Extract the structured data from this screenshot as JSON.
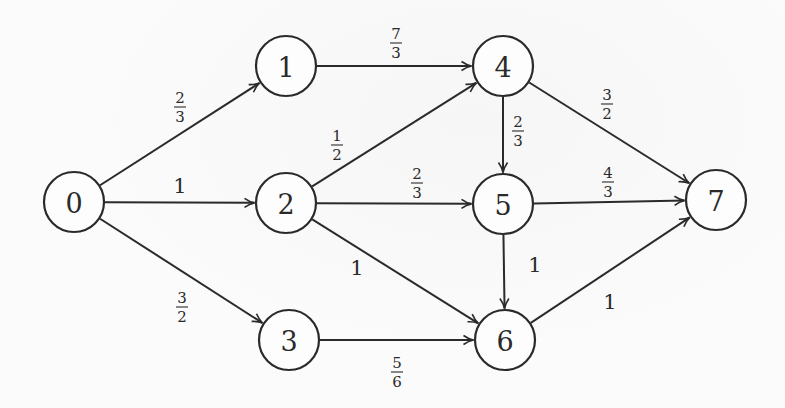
{
  "diagram": {
    "type": "directed-weighted-graph",
    "node_radius": 30,
    "nodes": [
      {
        "id": "0",
        "label": "0",
        "x": 74,
        "y": 202
      },
      {
        "id": "1",
        "label": "1",
        "x": 286,
        "y": 66
      },
      {
        "id": "2",
        "label": "2",
        "x": 286,
        "y": 203
      },
      {
        "id": "3",
        "label": "3",
        "x": 289,
        "y": 340
      },
      {
        "id": "4",
        "label": "4",
        "x": 503,
        "y": 66
      },
      {
        "id": "5",
        "label": "5",
        "x": 503,
        "y": 204
      },
      {
        "id": "6",
        "label": "6",
        "x": 505,
        "y": 340
      },
      {
        "id": "7",
        "label": "7",
        "x": 716,
        "y": 200
      }
    ],
    "edges": [
      {
        "from": "0",
        "to": "1",
        "weight": "2/3",
        "num": "2",
        "den": "3",
        "lx": 180,
        "ly": 107
      },
      {
        "from": "0",
        "to": "2",
        "weight": "1",
        "whole": "1",
        "lx": 180,
        "ly": 186
      },
      {
        "from": "0",
        "to": "3",
        "weight": "3/2",
        "num": "3",
        "den": "2",
        "lx": 182,
        "ly": 307
      },
      {
        "from": "1",
        "to": "4",
        "weight": "7/3",
        "num": "7",
        "den": "3",
        "lx": 396,
        "ly": 43
      },
      {
        "from": "2",
        "to": "4",
        "weight": "1/2",
        "num": "1",
        "den": "2",
        "lx": 337,
        "ly": 145
      },
      {
        "from": "2",
        "to": "5",
        "weight": "2/3",
        "num": "2",
        "den": "3",
        "lx": 417,
        "ly": 183
      },
      {
        "from": "2",
        "to": "6",
        "weight": "1",
        "whole": "1",
        "lx": 357,
        "ly": 268
      },
      {
        "from": "3",
        "to": "6",
        "weight": "5/6",
        "num": "5",
        "den": "6",
        "lx": 397,
        "ly": 372
      },
      {
        "from": "4",
        "to": "5",
        "weight": "2/3",
        "num": "2",
        "den": "3",
        "lx": 518,
        "ly": 131
      },
      {
        "from": "4",
        "to": "7",
        "weight": "3/2",
        "num": "3",
        "den": "2",
        "lx": 607,
        "ly": 104
      },
      {
        "from": "4",
        "to": "7",
        "weight": "3/2",
        "skip": true
      },
      {
        "from": "5",
        "to": "7",
        "weight": "4/3",
        "num": "4",
        "den": "3",
        "lx": 608,
        "ly": 182
      },
      {
        "from": "5",
        "to": "6",
        "weight": "1",
        "whole": "1",
        "lx": 535,
        "ly": 265
      },
      {
        "from": "6",
        "to": "7",
        "weight": "1",
        "whole": "1",
        "lx": 610,
        "ly": 302
      }
    ]
  }
}
